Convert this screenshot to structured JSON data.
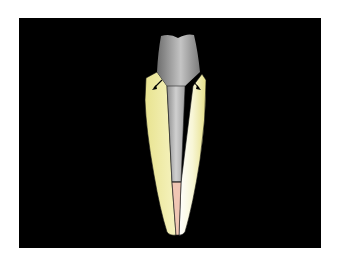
{
  "figure": {
    "type": "dental-illustration",
    "background_color": "#000000",
    "frame_color": "#ffffff",
    "parts": [
      {
        "name": "crown-core",
        "color": "#9a9a9a"
      },
      {
        "name": "post",
        "color": "#b0b0b0"
      },
      {
        "name": "root-dentin",
        "color": "#f2eea0"
      },
      {
        "name": "gutta-percha-filling",
        "color": "#f0c8b8"
      },
      {
        "name": "force-arrows",
        "color": "#000000",
        "count": 2
      }
    ]
  }
}
